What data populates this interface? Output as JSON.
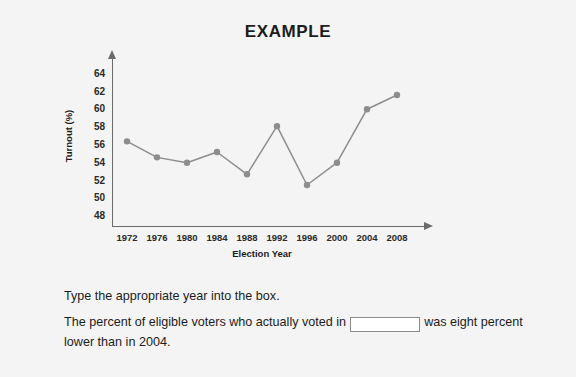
{
  "title": "EXAMPLE",
  "chart_data": {
    "type": "line",
    "title": "EXAMPLE",
    "xlabel": "Election Year",
    "ylabel": "Turnout (%)",
    "categories": [
      "1972",
      "1976",
      "1980",
      "1984",
      "1988",
      "1992",
      "1996",
      "2000",
      "2004",
      "2008"
    ],
    "values": [
      56.3,
      54.5,
      53.9,
      55.1,
      52.6,
      58.0,
      51.4,
      53.9,
      59.9,
      61.5
    ],
    "ytick_labels": [
      "64",
      "62",
      "60",
      "58",
      "56",
      "54",
      "52",
      "50",
      "48"
    ],
    "yticks": [
      64,
      62,
      60,
      58,
      56,
      54,
      52,
      50,
      48
    ],
    "ylim": [
      46.8,
      65.2
    ],
    "xlim": [
      1970,
      2010
    ],
    "grid": false,
    "legend": "none",
    "marker": "circle",
    "line_color": "#8d8d8d",
    "marker_color": "#8d8d8d",
    "axis_color": "#6b6b6b"
  },
  "question": {
    "prompt": "Type the appropriate year into the box.",
    "statement_before": "The percent of eligible voters who actually voted in",
    "statement_after": "was eight percent lower than in 2004.",
    "input_value": "",
    "input_placeholder": ""
  }
}
